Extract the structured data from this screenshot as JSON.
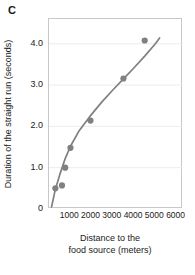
{
  "panel": {
    "label": "C"
  },
  "chart_data": {
    "type": "scatter",
    "title": "",
    "panel_label": "C",
    "xlabel": "Distance to the food source (meters)",
    "xlabel_line1": "Distance to the",
    "xlabel_line2": "food source (meters)",
    "ylabel": "Duration of the straight run (seconds)",
    "xlim": [
      0,
      6300
    ],
    "ylim": [
      0,
      4.6
    ],
    "grid": true,
    "grid_axis": "y",
    "legend": false,
    "legend_position": "none",
    "xticks": [
      1000,
      2000,
      3000,
      4000,
      5000,
      6000
    ],
    "xtick_labels": [
      "1000",
      "2000",
      "3000",
      "4000",
      "5000",
      "6000"
    ],
    "yticks": [
      0,
      1.0,
      2.0,
      3.0,
      4.0
    ],
    "ytick_labels": [
      "0",
      "1.0",
      "2.0",
      "3.0",
      "4.0"
    ],
    "marker_color": "#808080",
    "line_color": "#808080",
    "points": [
      {
        "x": 300,
        "y": 0.5
      },
      {
        "x": 610,
        "y": 0.57
      },
      {
        "x": 760,
        "y": 1.0
      },
      {
        "x": 1010,
        "y": 1.48
      },
      {
        "x": 1950,
        "y": 2.14
      },
      {
        "x": 3500,
        "y": 3.16
      },
      {
        "x": 4500,
        "y": 4.08
      }
    ],
    "x": [
      300,
      610,
      760,
      1010,
      1950,
      3500,
      4500
    ],
    "y": [
      0.5,
      0.57,
      1.0,
      1.48,
      2.14,
      3.16,
      4.08
    ],
    "fit_curve": {
      "name": "fitted curve",
      "x": [
        120,
        300,
        500,
        760,
        1010,
        1400,
        1950,
        2500,
        3000,
        3500,
        4000,
        4500,
        5000,
        5200
      ],
      "y": [
        0.05,
        0.48,
        0.82,
        1.22,
        1.52,
        1.88,
        2.26,
        2.6,
        2.88,
        3.15,
        3.42,
        3.7,
        4.0,
        4.14
      ]
    }
  },
  "colors": {
    "marker": "#808080",
    "curve": "#808080",
    "grid": "#ececec",
    "frame": "#c8c8c8",
    "text": "#1a1a1a",
    "background": "#ffffff"
  }
}
